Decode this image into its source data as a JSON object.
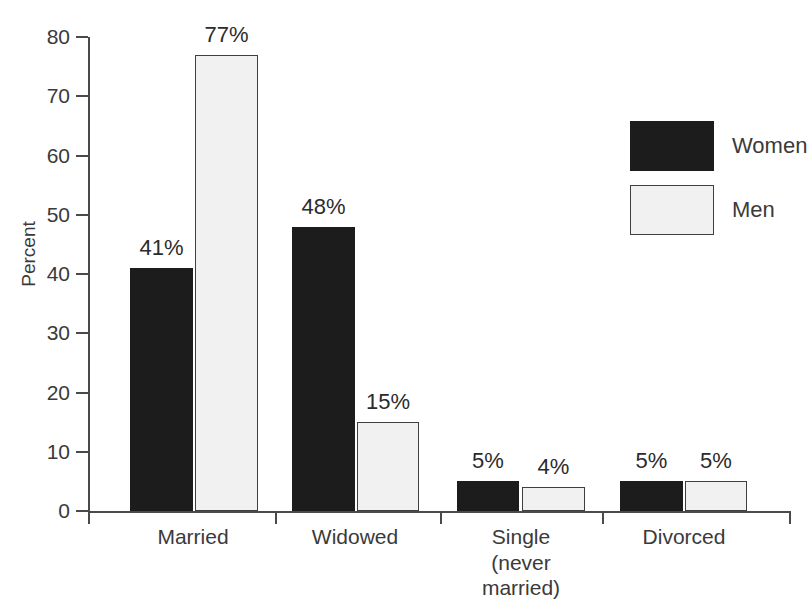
{
  "chart_data": {
    "type": "bar",
    "title": "",
    "subtitle": "",
    "xlabel": "",
    "ylabel": "Percent",
    "ylim": [
      0,
      80
    ],
    "yticks": [
      0,
      10,
      20,
      30,
      40,
      50,
      60,
      70,
      80
    ],
    "ytick_labels": [
      "0",
      "10",
      "20",
      "30",
      "40",
      "50",
      "60",
      "70",
      "80"
    ],
    "grid": false,
    "legend_position": "upper-right",
    "categories": [
      "Married",
      "Widowed",
      "Single\n(never\nmarried)",
      "Divorced"
    ],
    "series": [
      {
        "name": "Women",
        "color": "#1c1c1c",
        "values": [
          41,
          48,
          5,
          5
        ],
        "value_labels": [
          "41%",
          "48%",
          "5%",
          "5%"
        ]
      },
      {
        "name": "Men",
        "color": "#f1f1f1",
        "values": [
          77,
          15,
          4,
          5
        ],
        "value_labels": [
          "77%",
          "15%",
          "4%",
          "5%"
        ]
      }
    ],
    "legend": [
      {
        "label": "Women",
        "swatch": "women"
      },
      {
        "label": "Men",
        "swatch": "men"
      }
    ]
  },
  "bars": [
    {
      "name": "married-women",
      "label": "41%",
      "series": "women",
      "x": 130,
      "w": 63,
      "value": 41
    },
    {
      "name": "married-men",
      "label": "77%",
      "series": "men",
      "x": 195,
      "w": 63,
      "value": 77
    },
    {
      "name": "widowed-women",
      "label": "48%",
      "series": "women",
      "x": 292,
      "w": 63,
      "value": 48
    },
    {
      "name": "widowed-men",
      "label": "15%",
      "series": "men",
      "x": 357,
      "w": 62,
      "value": 15
    },
    {
      "name": "single-women",
      "label": "5%",
      "series": "women",
      "x": 457,
      "w": 62,
      "value": 5
    },
    {
      "name": "single-men",
      "label": "4%",
      "series": "men",
      "x": 522,
      "w": 63,
      "value": 4
    },
    {
      "name": "divorced-women",
      "label": "5%",
      "series": "women",
      "x": 620,
      "w": 63,
      "value": 5
    },
    {
      "name": "divorced-men",
      "label": "5%",
      "series": "men",
      "x": 685,
      "w": 62,
      "value": 5
    }
  ],
  "category_positions": [
    {
      "name": "married",
      "center": 193,
      "text": "Married"
    },
    {
      "name": "widowed",
      "center": 355,
      "text": "Widowed"
    },
    {
      "name": "single",
      "center": 521,
      "text": "Single\n(never\nmarried)"
    },
    {
      "name": "divorced",
      "center": 684,
      "text": "Divorced"
    }
  ],
  "x_tick_positions": [
    88,
    275,
    440,
    602,
    789
  ]
}
